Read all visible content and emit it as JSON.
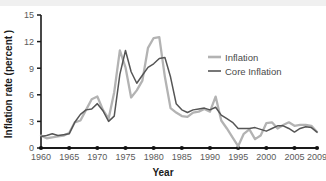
{
  "chart_data": {
    "type": "line",
    "title": "",
    "xlabel": "Year",
    "ylabel": "Inflation rate (percent )",
    "xlim": [
      1960,
      2009
    ],
    "ylim": [
      0,
      15
    ],
    "yticks": [
      0,
      3,
      6,
      9,
      12,
      15
    ],
    "xticks": [
      1960,
      1965,
      1970,
      1975,
      1980,
      1985,
      1990,
      1995,
      2000,
      2005,
      2009
    ],
    "ytick_labels": [
      "0",
      "3",
      "6",
      "9",
      "12",
      "15"
    ],
    "xtick_labels": [
      "1960",
      "1965",
      "1970",
      "1975",
      "1980",
      "1985",
      "1990",
      "1995",
      "2000",
      "2005",
      "2009"
    ],
    "grid": false,
    "legend_position": "right-upper",
    "x": [
      1960,
      1961,
      1962,
      1963,
      1964,
      1965,
      1966,
      1967,
      1968,
      1969,
      1970,
      1971,
      1972,
      1973,
      1974,
      1975,
      1976,
      1977,
      1978,
      1979,
      1980,
      1981,
      1982,
      1983,
      1984,
      1985,
      1986,
      1987,
      1988,
      1989,
      1990,
      1991,
      1992,
      1993,
      1994,
      1995,
      1996,
      1997,
      1998,
      1999,
      2000,
      2001,
      2002,
      2003,
      2004,
      2005,
      2006,
      2007,
      2008,
      2009
    ],
    "series": [
      {
        "name": "Inflation",
        "color": "#b3b3b3",
        "values": [
          1.4,
          1.1,
          1.2,
          1.3,
          1.4,
          1.7,
          2.9,
          3.1,
          4.3,
          5.5,
          5.8,
          4.3,
          3.3,
          6.3,
          11.0,
          9.1,
          5.7,
          6.5,
          7.6,
          11.3,
          12.4,
          12.5,
          8.0,
          4.5,
          4.0,
          3.6,
          3.5,
          4.0,
          4.1,
          4.4,
          4.1,
          5.8,
          3.1,
          2.2,
          1.2,
          0.2,
          1.6,
          2.1,
          1.0,
          1.4,
          2.8,
          2.9,
          2.2,
          2.6,
          2.9,
          2.5,
          2.6,
          2.6,
          2.5,
          1.8
        ]
      },
      {
        "name": "Core Inflation",
        "color": "#555555",
        "values": [
          1.3,
          1.4,
          1.6,
          1.4,
          1.5,
          1.6,
          2.9,
          3.8,
          4.3,
          4.4,
          5.0,
          4.2,
          3.0,
          3.6,
          8.3,
          11.0,
          8.6,
          7.3,
          8.2,
          9.1,
          9.5,
          10.1,
          10.2,
          8.0,
          5.0,
          4.3,
          4.0,
          4.3,
          4.4,
          4.5,
          4.3,
          4.6,
          3.7,
          3.3,
          2.9,
          2.2,
          2.2,
          2.2,
          2.3,
          2.1,
          1.9,
          2.2,
          2.5,
          2.5,
          2.2,
          1.8,
          2.2,
          2.4,
          2.3,
          1.8
        ]
      }
    ],
    "xaxis_marker_years": [
      1960,
      1965,
      1970,
      1975,
      1980,
      1985,
      1990,
      1995,
      2000,
      2005,
      2009
    ]
  },
  "legend": {
    "items": [
      {
        "label": "Inflation"
      },
      {
        "label": "Core Inflation"
      }
    ]
  },
  "axes": {
    "x_title": "Year",
    "y_title": "Inflation rate (percent )"
  },
  "colors": {
    "inflation": "#b3b3b3",
    "core_inflation": "#555555",
    "axis": "#1a1a1a",
    "tick_text": "#5a5a5a",
    "background": "#ffffff",
    "top_band": "#f0f0f0"
  }
}
